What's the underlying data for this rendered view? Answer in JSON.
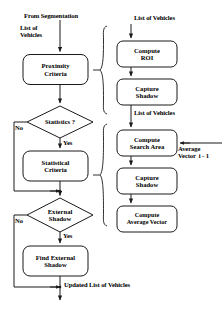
{
  "diagram": {
    "title_note": "From Segmentation",
    "labels": {
      "from_segmentation": "From Segmentation",
      "list_of_vehicles_left": "List of\nVehicles",
      "no_1": "No",
      "yes_1": "Yes",
      "no_2": "No",
      "yes_2": "Yes",
      "statistics_q": "Statistics ?",
      "external_shadow_q": "External\nShadow",
      "list_of_vehicles_top_right": "List of Vehicles",
      "list_of_vehicles_mid_right": "List of Vehicles",
      "average_vector_prev": "Average\nVector  i - 1",
      "updated_list_of_vehicles": "Updated List of Vehicles"
    },
    "left_column": {
      "nodes": [
        {
          "id": "proximity-criteria",
          "label": "Proximity\nCriteria",
          "shape": "rounded-rect"
        },
        {
          "id": "statistics-decision",
          "label": "Statistics ?",
          "shape": "diamond"
        },
        {
          "id": "statistical-criteria",
          "label": "Statistical\nCriteria",
          "shape": "rounded-rect"
        },
        {
          "id": "external-shadow-decision",
          "label": "External\nShadow",
          "shape": "diamond"
        },
        {
          "id": "find-external-shadow",
          "label": "Find External\nShadow",
          "shape": "rounded-rect"
        }
      ]
    },
    "right_column": {
      "group_one": [
        {
          "id": "compute-roi",
          "label": "Compute\nROI",
          "shape": "rounded-rect"
        },
        {
          "id": "capture-shadow-1",
          "label": "Capture\nShadow",
          "shape": "rounded-rect"
        }
      ],
      "group_two": [
        {
          "id": "compute-search-area",
          "label": "Compute\nSearch Area",
          "shape": "rounded-rect"
        },
        {
          "id": "capture-shadow-2",
          "label": "Capture\nShadow",
          "shape": "rounded-rect"
        },
        {
          "id": "compute-average-vector",
          "label": "Compute\nAverage Vector",
          "shape": "rounded-rect"
        }
      ]
    },
    "colors": {
      "stroke": "#1a1a1a",
      "text": "#000000",
      "background": "#ffffff"
    }
  }
}
